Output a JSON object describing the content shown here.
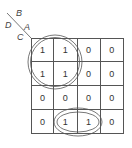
{
  "diagram": {
    "type": "karnaugh-map",
    "variable_labels": {
      "B": "B",
      "A": "A",
      "D": "D",
      "C": "C"
    },
    "cells": [
      [
        "1",
        "1",
        "0",
        "0"
      ],
      [
        "1",
        "1",
        "0",
        "0"
      ],
      [
        "0",
        "0",
        "0",
        "0"
      ],
      [
        "0",
        "1",
        "1",
        "0"
      ]
    ],
    "groups": [
      {
        "name": "quad-top-left",
        "shape": "double-circle",
        "rows": [
          0,
          1
        ],
        "cols": [
          0,
          1
        ]
      },
      {
        "name": "pair-bottom-middle",
        "shape": "double-ellipse",
        "rows": [
          3
        ],
        "cols": [
          1,
          2
        ]
      }
    ],
    "colors": {
      "line": "#555555",
      "text": "#333333",
      "background": "#ffffff"
    }
  }
}
